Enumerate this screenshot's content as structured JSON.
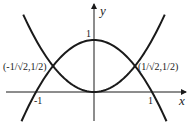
{
  "chart_data": {
    "type": "line",
    "title": "",
    "xlabel": "x",
    "ylabel": "y",
    "xlim": [
      -1.25,
      1.6
    ],
    "ylim": [
      -0.6,
      1.6
    ],
    "grid": false,
    "series": [
      {
        "name": "y = x^2",
        "formula": "x^2",
        "x": [
          -1.22,
          -1,
          -0.7071,
          -0.5,
          0,
          0.5,
          0.7071,
          1,
          1.22
        ],
        "y": [
          1.49,
          1,
          0.5,
          0.25,
          0,
          0.25,
          0.5,
          1,
          1.49
        ]
      },
      {
        "name": "y = 1 - x^2",
        "formula": "1-x^2",
        "x": [
          -1.25,
          -1,
          -0.7071,
          -0.5,
          0,
          0.5,
          0.7071,
          1,
          1.25
        ],
        "y": [
          -0.5625,
          0,
          0.5,
          0.75,
          1,
          0.75,
          0.5,
          0,
          -0.5625
        ]
      }
    ],
    "annotations": [
      {
        "text": "(-1/√2,1/2)",
        "x": -0.7071,
        "y": 0.5
      },
      {
        "text": "(1/√2,1/2)",
        "x": 0.7071,
        "y": 0.5
      }
    ],
    "ticks": {
      "x": [
        "-1",
        "1"
      ],
      "y": [
        "1"
      ]
    }
  },
  "labels": {
    "x_axis": "x",
    "y_axis": "y",
    "tick_x_neg1": "-1",
    "tick_x_pos1": "1",
    "tick_y_1": "1",
    "point_left": "(-1/√2,1/2)",
    "point_right": "(1/√2,1/2)"
  },
  "colors": {
    "stroke": "#1a1a1a",
    "background": "#ffffff"
  }
}
